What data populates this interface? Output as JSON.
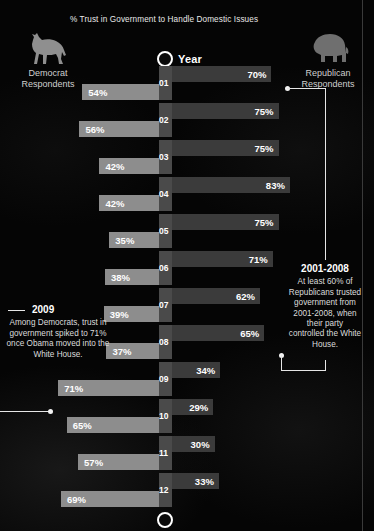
{
  "title": "% Trust in Government to Handle Domestic Issues",
  "axis": {
    "label": "Year"
  },
  "parties": {
    "left": {
      "name_line1": "Democrat",
      "name_line2": "Respondents",
      "icon": "donkey-icon",
      "color": "#8d8d8d"
    },
    "right": {
      "name_line1": "Republican",
      "name_line2": "Respondents",
      "icon": "elephant-icon",
      "color": "#3b3b3b"
    }
  },
  "notes": {
    "left": {
      "heading": "2009",
      "body": "Among Democrats, trust in government spiked to 71% once Obama moved into the White House."
    },
    "right": {
      "heading": "2001-2008",
      "body": "At least 60% of Republicans trusted government from 2001-2008, when their party controlled the White House."
    }
  },
  "chart_data": {
    "type": "bar",
    "title": "% Trust in Government to Handle Domestic Issues",
    "xlabel": "",
    "ylabel": "Year",
    "orientation": "horizontal-diverging",
    "xlim": [
      0,
      100
    ],
    "grid": false,
    "legend_position": "top",
    "categories": [
      "01",
      "02",
      "03",
      "04",
      "05",
      "06",
      "07",
      "08",
      "09",
      "10",
      "11",
      "12"
    ],
    "series": [
      {
        "name": "Democrat Respondents",
        "side": "left",
        "color": "#8d8d8d",
        "values": [
          54,
          56,
          42,
          42,
          35,
          38,
          39,
          37,
          71,
          65,
          57,
          69
        ]
      },
      {
        "name": "Republican Respondents",
        "side": "right",
        "color": "#3b3b3b",
        "values": [
          70,
          75,
          75,
          83,
          75,
          71,
          62,
          65,
          34,
          29,
          30,
          33
        ]
      }
    ],
    "labels": {
      "left": [
        "54%",
        "56%",
        "42%",
        "42%",
        "35%",
        "38%",
        "39%",
        "37%",
        "71%",
        "65%",
        "57%",
        "69%"
      ],
      "right": [
        "70%",
        "75%",
        "75%",
        "83%",
        "75%",
        "71%",
        "62%",
        "65%",
        "34%",
        "29%",
        "30%",
        "33%"
      ]
    },
    "annotations": [
      {
        "text": "2001-2008",
        "target_category": "01",
        "target_series": "Republican Respondents"
      },
      {
        "text": "2009",
        "target_category": "09",
        "target_series": "Democrat Respondents"
      }
    ]
  }
}
